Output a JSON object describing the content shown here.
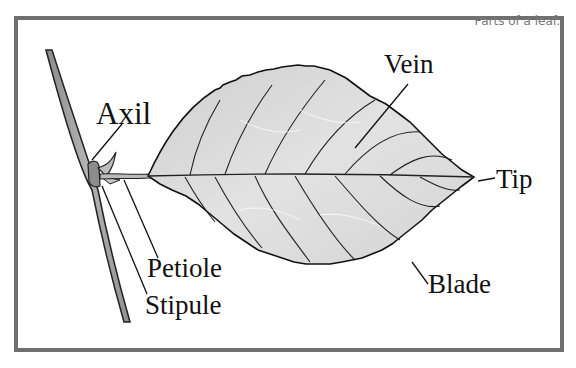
{
  "diagram": {
    "caption": "Parts of a leaf.",
    "labels": {
      "axil": "Axil",
      "vein": "Vein",
      "tip": "Tip",
      "petiole": "Petiole",
      "stipule": "Stipule",
      "blade": "Blade"
    },
    "colors": {
      "frame_border": "#6f6f6f",
      "caption_text": "#777777",
      "leaf_fill": "#d9d9d9",
      "outline": "#111111"
    }
  }
}
